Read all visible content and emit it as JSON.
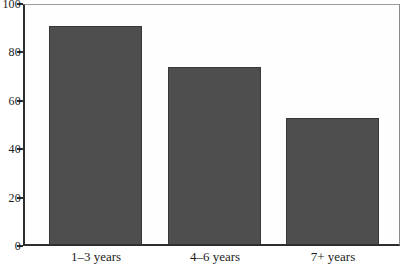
{
  "chart_data": {
    "type": "bar",
    "title": "",
    "xlabel": "",
    "ylabel": "",
    "categories": [
      "1–3 years",
      "4–6 years",
      "7+ years"
    ],
    "values": [
      90,
      73,
      52
    ],
    "ylim": [
      0,
      100
    ],
    "yticks": [
      "0",
      "20",
      "40",
      "60",
      "80",
      "100"
    ],
    "ytick_values": [
      0,
      20,
      40,
      60,
      80,
      100
    ],
    "grid": false,
    "legend_position": "none",
    "bar_color": "#4e4e4e",
    "bar_edge_color": "#383838",
    "axis_color": "#2e2e2e",
    "frame_color": "#9a9a9a",
    "text_color": "#1c1c1c",
    "background_color": "#ffffff"
  }
}
